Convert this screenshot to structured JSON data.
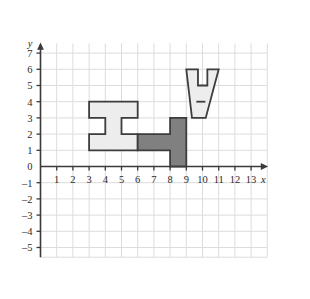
{
  "figure": {
    "axes": {
      "x_label": "x",
      "y_label": "y",
      "x_ticks": [
        "1",
        "2",
        "3",
        "4",
        "5",
        "6",
        "7",
        "8",
        "9",
        "10",
        "11",
        "12",
        "13"
      ],
      "y_ticks_positive": [
        "7",
        "6",
        "5",
        "4",
        "3",
        "2",
        "1"
      ],
      "y_tick_zero": "0",
      "y_ticks_negative": [
        "–1",
        "–2",
        "–3",
        "–4",
        "–5"
      ],
      "x_min": 0,
      "x_max": 14,
      "y_min": -5.6,
      "y_max": 7.6,
      "grid": true,
      "grid_color": "#dcdcdc",
      "axis_color": "#3a3a3a"
    },
    "colors": {
      "light_fill": "#ededed",
      "dark_fill": "#808080",
      "outline": "#3d3d3d",
      "background": "#ffffff"
    },
    "shapes": [
      {
        "name": "i-shape-light",
        "fill": "light_fill",
        "description": "I-beam shaped polygon on the left",
        "points": [
          [
            3,
            4
          ],
          [
            6,
            4
          ],
          [
            6,
            3
          ],
          [
            5,
            3
          ],
          [
            5,
            2
          ],
          [
            6,
            2
          ],
          [
            6,
            1
          ],
          [
            3,
            1
          ],
          [
            3,
            2
          ],
          [
            4,
            2
          ],
          [
            4,
            3
          ],
          [
            3,
            3
          ]
        ]
      },
      {
        "name": "l-shape-dark",
        "fill": "dark_fill",
        "description": "Dark gray L shaped polygon in the middle",
        "points": [
          [
            6,
            2
          ],
          [
            8,
            2
          ],
          [
            8,
            3
          ],
          [
            9,
            3
          ],
          [
            9,
            0
          ],
          [
            8,
            0
          ],
          [
            8,
            1
          ],
          [
            6,
            1
          ]
        ]
      },
      {
        "name": "v-shape-light",
        "fill": "light_fill",
        "description": "V / trophy shaped polygon on the upper right",
        "points": [
          [
            9,
            6
          ],
          [
            9.72,
            6
          ],
          [
            9.72,
            5
          ],
          [
            10.3,
            5
          ],
          [
            10.3,
            6
          ],
          [
            11,
            6
          ],
          [
            10.2,
            3
          ],
          [
            9.35,
            3
          ]
        ]
      }
    ],
    "marks": [
      {
        "name": "v-shape-inner-line",
        "description": "Short horizontal segment inside the V shape at y = 4",
        "x1": 9.62,
        "x2": 10.18,
        "y": 4
      }
    ]
  }
}
